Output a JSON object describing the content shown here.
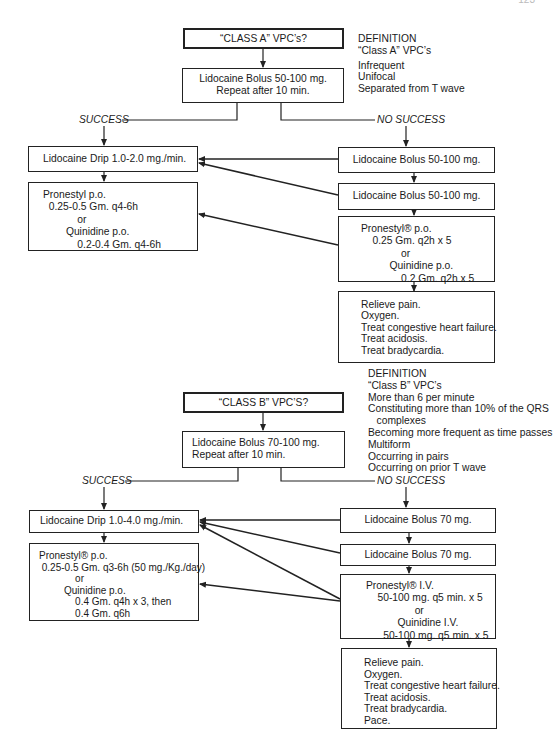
{
  "page_number": "123",
  "class_a": {
    "title": "“CLASS A” VPC’s?",
    "definition": {
      "heading": "DEFINITION",
      "subheading": "“Class A” VPC’s",
      "criteria": [
        "Infrequent",
        "Unifocal",
        "Separated from T wave"
      ]
    },
    "initial": [
      "Lidocaine Bolus 50-100 mg.",
      "Repeat after 10 min."
    ],
    "success_label": "SUCCESS",
    "no_success_label": "NO SUCCESS",
    "success_path": {
      "drip": "Lidocaine Drip 1.0-2.0 mg./min.",
      "oral": [
        "Pronestyl p.o.",
        "  0.25-0.5 Gm. q4-6h",
        "            or",
        "        Quinidine p.o.",
        "            0.2-0.4 Gm. q4-6h"
      ]
    },
    "no_success_path": {
      "bolus_1": "Lidocaine Bolus 50-100 mg.",
      "bolus_2": "Lidocaine Bolus 50-100 mg.",
      "oral": [
        "Pronestyl® p.o.",
        "    0.25 Gm. q2h x 5",
        "              or",
        "          Quinidine p.o.",
        "              0.2 Gm. q2h x 5"
      ],
      "supportive": [
        "Relieve pain.",
        "Oxygen.",
        "Treat congestive heart failure.",
        "Treat acidosis.",
        "Treat bradycardia."
      ]
    }
  },
  "class_b": {
    "title": "“CLASS B” VPC’S?",
    "definition": {
      "heading": "DEFINITION",
      "subheading": "“Class B” VPC’s",
      "criteria": [
        "More than 6 per minute",
        "Constituting more than 10% of the QRS",
        "   complexes",
        "Becoming more frequent as time passes",
        "Multiform",
        "Occurring in pairs",
        "Occurring on prior T wave"
      ]
    },
    "initial": [
      "Lidocaine Bolus 70-100 mg.",
      "Repeat after 10 min."
    ],
    "success_label": "SUCCESS",
    "no_success_label": "NO SUCCESS",
    "success_path": {
      "drip": "Lidocaine Drip 1.0-4.0 mg./min.",
      "oral": [
        "Pronestyl® p.o.",
        " 0.25-0.5 Gm. q3-6h (50 mg./Kg./day)",
        "             or",
        "         Quinidine p.o.",
        "             0.4 Gm. q4h x 3, then",
        "             0.4 Gm. q6h"
      ]
    },
    "no_success_path": {
      "bolus_1": "Lidocaine Bolus 70 mg.",
      "bolus_2": "Lidocaine Bolus 70 mg.",
      "iv": [
        "Pronestyl® I.V.",
        "    50-100 mg. q5 min. x 5",
        "                 or",
        "           Quinidine I.V.",
        "      50-100 mg. q5 min. x 5"
      ],
      "supportive": [
        "Relieve pain.",
        "Oxygen.",
        "Treat congestive heart failure.",
        "Treat acidosis.",
        "Treat bradycardia.",
        "Pace."
      ]
    }
  }
}
